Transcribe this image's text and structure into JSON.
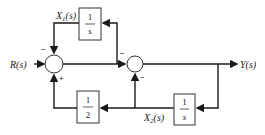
{
  "diagram": {
    "type": "block_diagram",
    "input": {
      "label": "R(s)"
    },
    "output": {
      "label": "Y(s)"
    },
    "blocks": [
      {
        "id": "top_integrator",
        "numerator": "1",
        "denominator": "s",
        "signal_label": "X",
        "signal_sub": "1",
        "signal_suffix": "(s)"
      },
      {
        "id": "gain_half",
        "numerator": "1",
        "denominator": "2"
      },
      {
        "id": "bottom_integrator",
        "numerator": "1",
        "denominator": "s",
        "signal_label": "X",
        "signal_sub": "2",
        "signal_suffix": "(s)"
      }
    ],
    "summing_junctions": [
      {
        "id": "sum1",
        "signs": {
          "top": "−",
          "bottom": "+"
        }
      },
      {
        "id": "sum2",
        "signs": {
          "left_top": "−",
          "bottom": "−"
        }
      }
    ]
  }
}
